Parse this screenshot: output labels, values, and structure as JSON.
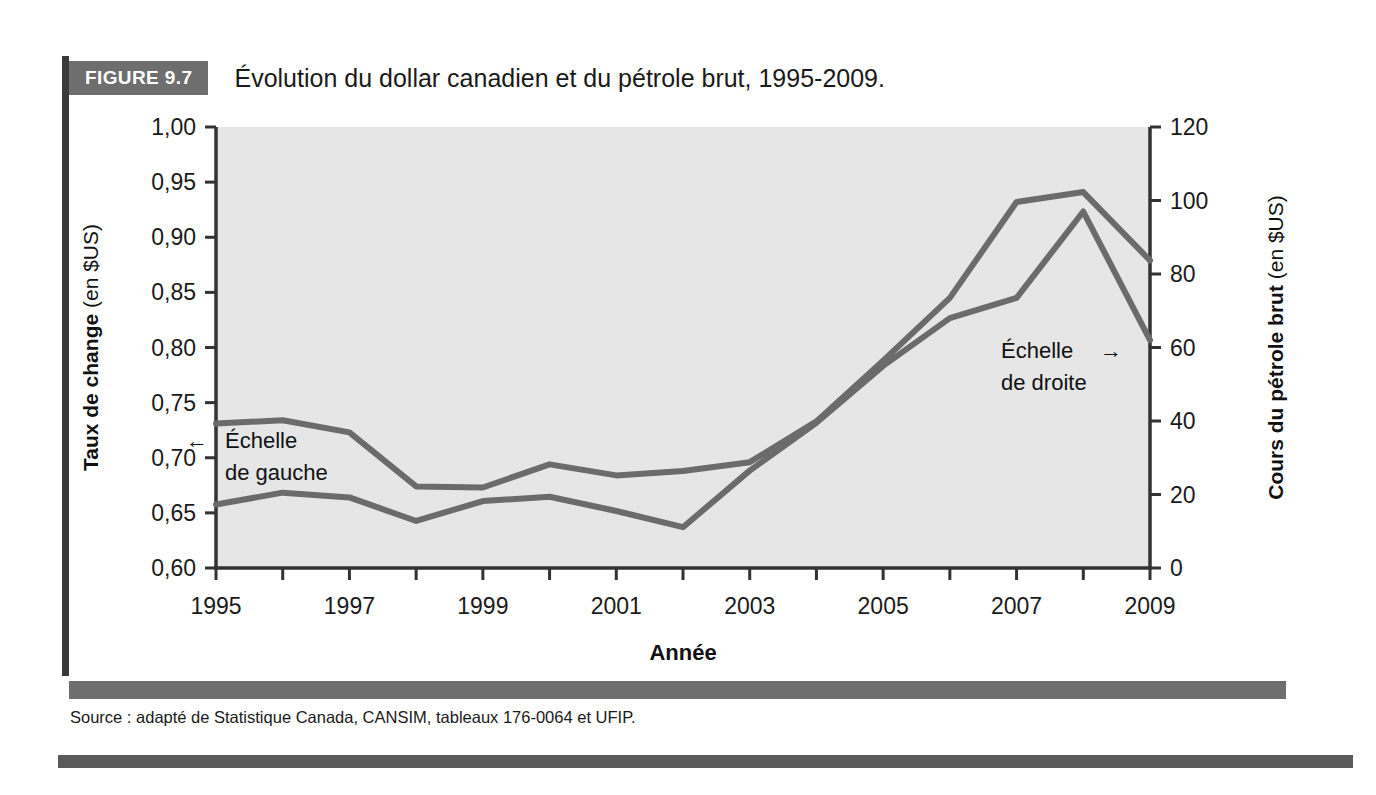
{
  "figure": {
    "badge": "FIGURE 9.7",
    "title": "Évolution du dollar canadien et du pétrole brut, 1995-2009.",
    "source": "Source : adapté de Statistique Canada, CANSIM, tableaux 176-0064 et UFIP.",
    "colors": {
      "badge_bg": "#6e6e6e",
      "line": "#6b6b6b",
      "plot_bg": "#e6e6e6",
      "axis": "#333333",
      "rule": "#5a5a5a"
    }
  },
  "chart_data": {
    "type": "line",
    "title": "Évolution du dollar canadien et du pétrole brut, 1995-2009.",
    "xlabel": "Année",
    "grid": false,
    "legend_position": "inline-annotations",
    "x": [
      1995,
      1996,
      1997,
      1998,
      1999,
      2000,
      2001,
      2002,
      2003,
      2004,
      2005,
      2006,
      2007,
      2008,
      2009
    ],
    "xtick_labels": [
      "1995",
      "",
      "1997",
      "",
      "1999",
      "",
      "2001",
      "",
      "2003",
      "",
      "2005",
      "",
      "2007",
      "",
      "2009"
    ],
    "xlim": [
      1995,
      2009
    ],
    "axes": [
      {
        "side": "left",
        "label_bold": "Taux de change",
        "label_regular": " (en $US)",
        "ylim": [
          0.6,
          1.0
        ],
        "ytick_labels": [
          "0,60",
          "0,65",
          "0,70",
          "0,75",
          "0,80",
          "0,85",
          "0,90",
          "0,95",
          "1,00"
        ],
        "yticks": [
          0.6,
          0.65,
          0.7,
          0.75,
          0.8,
          0.85,
          0.9,
          0.95,
          1.0
        ]
      },
      {
        "side": "right",
        "label_bold": "Cours du pétrole brut",
        "label_regular": " (en $US)",
        "ylim": [
          0,
          120
        ],
        "ytick_labels": [
          "0",
          "20",
          "40",
          "60",
          "80",
          "100",
          "120"
        ],
        "yticks": [
          0,
          20,
          40,
          60,
          80,
          100,
          120
        ]
      }
    ],
    "series": [
      {
        "name": "Taux de change",
        "axis": "left",
        "unit": "$US",
        "values": [
          0.731,
          0.734,
          0.723,
          0.674,
          0.673,
          0.694,
          0.684,
          0.688,
          0.696,
          0.733,
          0.788,
          0.845,
          0.932,
          0.941,
          0.879
        ]
      },
      {
        "name": "Cours du pétrole brut",
        "axis": "right",
        "unit": "$US",
        "values": [
          17.3,
          20.5,
          19.2,
          12.8,
          18.2,
          19.4,
          15.5,
          11.1,
          26.5,
          39.5,
          55.0,
          68.0,
          73.5,
          97.0,
          62.0
        ]
      }
    ],
    "annotations": [
      {
        "text_line1": "Échelle",
        "text_line2": "de gauche",
        "arrow": "←",
        "target_series": "Taux de change"
      },
      {
        "text_line1": "Échelle",
        "text_line2": "de droite",
        "arrow": "→",
        "target_series": "Cours du pétrole brut"
      }
    ]
  }
}
